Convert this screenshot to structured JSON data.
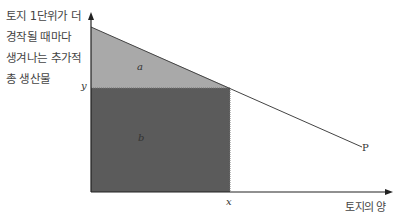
{
  "diagram": {
    "y_axis_title_lines": [
      "토지 1단위가 더",
      "경작될 때마다",
      "생겨나는 추가적",
      "총 생산물"
    ],
    "x_axis_title": "토지의 양",
    "area_a_label": "a",
    "area_b_label": "b",
    "y_tick_label": "y",
    "x_tick_label": "x",
    "curve_label": "P",
    "colors": {
      "area_a": "#a9a9a9",
      "area_b": "#5b5b5b",
      "axis": "#222222",
      "curve": "#444444",
      "background": "#ffffff"
    }
  }
}
